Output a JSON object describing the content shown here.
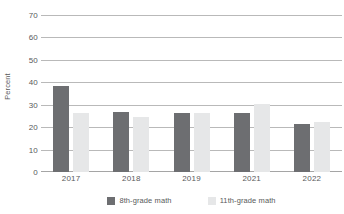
{
  "chart_data": {
    "type": "bar",
    "title": "",
    "subtitle": "",
    "xlabel": "",
    "ylabel": "Percent",
    "ylim": [
      0,
      70
    ],
    "ytick_step": 10,
    "yticks": [
      70,
      60,
      50,
      40,
      30,
      20,
      10,
      0
    ],
    "ytick_labels": [
      "70",
      "60",
      "50",
      "40",
      "30",
      "20",
      "10",
      "0"
    ],
    "categories": [
      "2017",
      "2018",
      "2019",
      "2021",
      "2022"
    ],
    "series": [
      {
        "name": "8th-grade math",
        "color": "#6d6e71",
        "values": [
          38.5,
          26.8,
          26.7,
          26.7,
          21.5
        ]
      },
      {
        "name": "11th-grade math",
        "color": "#e6e7e8",
        "values": [
          26.5,
          24.5,
          26.6,
          30.3,
          22.4
        ]
      }
    ],
    "grid": true,
    "grid_axis": "y",
    "legend_position": "bottom",
    "annotations": []
  },
  "colors": {
    "series_8th": "#6d6e71",
    "series_11th": "#e6e7e8",
    "gridline": "#b9b9b9",
    "text": "#58595b",
    "background": "#ffffff"
  }
}
